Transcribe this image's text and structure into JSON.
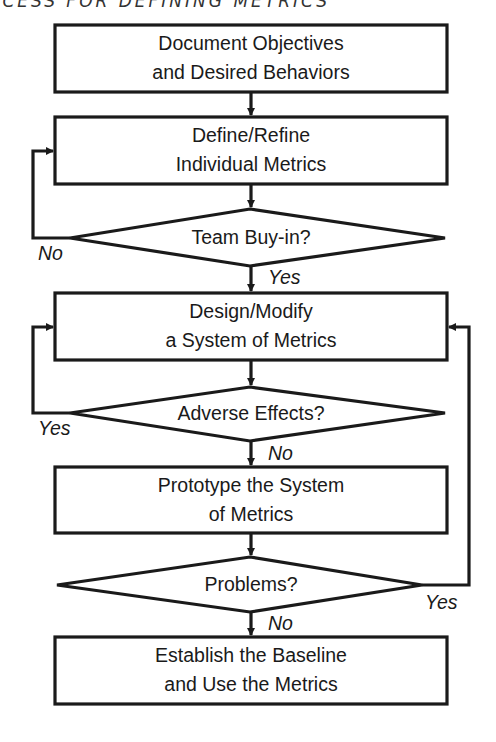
{
  "title": "OCESS FOR DEFINING METRICS",
  "colors": {
    "stroke": "#1a1a1a",
    "background": "#ffffff"
  },
  "nodes": [
    {
      "id": "document-objectives",
      "type": "process",
      "lines": [
        "Document Objectives",
        "and Desired Behaviors"
      ]
    },
    {
      "id": "define-refine",
      "type": "process",
      "lines": [
        "Define/Refine",
        "Individual Metrics"
      ]
    },
    {
      "id": "team-buy-in",
      "type": "decision",
      "lines": [
        "Team Buy-in?"
      ]
    },
    {
      "id": "design-modify",
      "type": "process",
      "lines": [
        "Design/Modify",
        "a System of Metrics"
      ]
    },
    {
      "id": "adverse-effects",
      "type": "decision",
      "lines": [
        "Adverse Effects?"
      ]
    },
    {
      "id": "prototype",
      "type": "process",
      "lines": [
        "Prototype the System",
        "of Metrics"
      ]
    },
    {
      "id": "problems",
      "type": "decision",
      "lines": [
        "Problems?"
      ]
    },
    {
      "id": "establish-baseline",
      "type": "process",
      "lines": [
        "Establish the Baseline",
        "and Use the Metrics"
      ]
    }
  ],
  "edge_labels": {
    "team_no": "No",
    "team_yes": "Yes",
    "adverse_yes": "Yes",
    "adverse_no": "No",
    "problems_yes": "Yes",
    "problems_no": "No"
  }
}
